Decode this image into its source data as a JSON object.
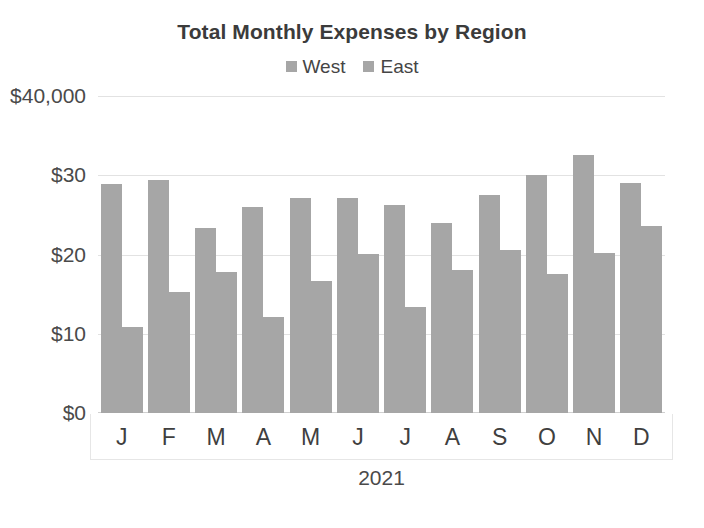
{
  "chart_data": {
    "type": "bar",
    "title": "Total Monthly Expenses by Region",
    "xlabel": "2021",
    "ylabel": "",
    "categories": [
      "J",
      "F",
      "M",
      "A",
      "M",
      "J",
      "J",
      "A",
      "S",
      "O",
      "N",
      "D"
    ],
    "series": [
      {
        "name": "West",
        "color": "#a6a6a6",
        "values": [
          28.9,
          29.4,
          23.3,
          26.0,
          27.1,
          27.1,
          26.2,
          24.0,
          27.5,
          30.0,
          32.5,
          29.0
        ]
      },
      {
        "name": "East",
        "color": "#a6a6a6",
        "values": [
          10.8,
          15.3,
          17.8,
          12.1,
          16.7,
          20.1,
          13.4,
          18.0,
          20.6,
          17.6,
          20.2,
          23.6
        ]
      }
    ],
    "ylim": [
      0,
      40
    ],
    "y_ticks": [
      0,
      10,
      20,
      30,
      40
    ],
    "y_tick_labels": [
      "$0",
      "$10",
      "$20",
      "$30",
      "$40,000"
    ],
    "grid": true,
    "legend_position": "top"
  },
  "colors": {
    "bar_gray": "#a6a6a6",
    "gridline": "#e2e2e2",
    "title_text": "#3b3b3b",
    "axis_text": "#4a4a4a",
    "background": "#ffffff"
  }
}
